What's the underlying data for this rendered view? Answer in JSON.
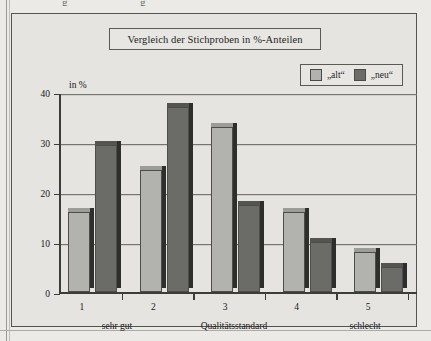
{
  "page": {
    "top_clipped_marks": [
      "g",
      "g"
    ]
  },
  "chart": {
    "title": "Vergleich der Stichproben in %-Anteilen",
    "y_axis_caption": "in %",
    "legend": [
      {
        "label": "„alt“",
        "color": "#b2b2ae",
        "name": "alt"
      },
      {
        "label": "„neu“",
        "color": "#6b6b68",
        "name": "neu"
      }
    ],
    "x_captions": {
      "left": "sehr gut",
      "center": "Qualitätsstandard",
      "right": "schlecht"
    }
  },
  "chart_data": {
    "type": "bar",
    "title": "Vergleich der Stichproben in %-Anteilen",
    "xlabel": "Qualitätsstandard",
    "ylabel": "in %",
    "categories": [
      "1",
      "2",
      "3",
      "4",
      "5"
    ],
    "series": [
      {
        "name": "„alt“",
        "color": "#b2b2ae",
        "values": [
          16,
          24.5,
          33,
          16,
          8
        ]
      },
      {
        "name": "„neu“",
        "color": "#6b6b68",
        "values": [
          29.5,
          37,
          17.5,
          10,
          5
        ]
      }
    ],
    "ylim": [
      0,
      40
    ],
    "yticks": [
      0,
      10,
      20,
      30,
      40
    ],
    "ytick_labels": [
      "0",
      "10",
      "20",
      "30",
      "40"
    ],
    "grid": true,
    "legend_position": "top-right",
    "annotations": [
      "sehr gut",
      "Qualitätsstandard",
      "schlecht"
    ]
  }
}
